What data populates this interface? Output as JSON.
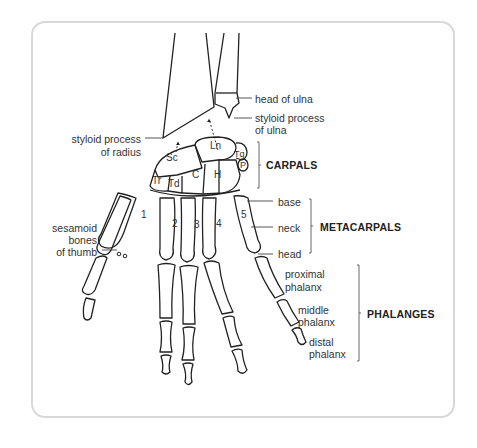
{
  "diagram": {
    "labels": {
      "head_of_ulna": "head of ulna",
      "styloid_ulna_1": "styloid process",
      "styloid_ulna_2": "of ulna",
      "styloid_radius_1": "styloid process",
      "styloid_radius_2": "of radius",
      "sesamoid_1": "sesamoid",
      "sesamoid_2": "bones",
      "sesamoid_3": "of thumb",
      "base": "base",
      "neck": "neck",
      "head": "head",
      "proximal_1": "proximal",
      "proximal_2": "phalanx",
      "middle_1": "middle",
      "middle_2": "phalanx",
      "distal_1": "distal",
      "distal_2": "phalanx"
    },
    "groups": {
      "carpals": "CARPALS",
      "metacarpals": "METACARPALS",
      "phalanges": "PHALANGES"
    },
    "carpal_bones": {
      "sc": "Sc",
      "ln": "Ln",
      "tq": "Tq",
      "p": "P",
      "tr": "Tr",
      "td": "Td",
      "c": "C",
      "h": "H"
    },
    "metacarpal_numbers": [
      "1",
      "2",
      "3",
      "4",
      "5"
    ]
  }
}
